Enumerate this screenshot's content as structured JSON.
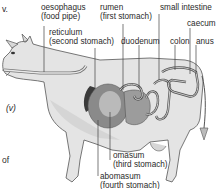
{
  "figure": {
    "labels": {
      "oesophagus": [
        "oesophagus",
        "(food pipe)"
      ],
      "reticulum": [
        "reticulum",
        "(second stomach)"
      ],
      "rumen": [
        "rumen",
        "(first stomach)"
      ],
      "small_intestine": "small intestine",
      "caecum": "caecum",
      "duodenum": "duodenum",
      "colon": "colon",
      "anus": "anus",
      "omasum": [
        "omasum",
        "(third stomach)"
      ],
      "abomasum": [
        "abomasum",
        "(fourth stomach)"
      ]
    },
    "side_text": {
      "top_fragment": "v.",
      "marker": "(v)",
      "bottom_fragment": "of"
    },
    "colors": {
      "body": "#e4e4e4",
      "body_shade": "#c8c8c8",
      "outline": "#555555",
      "rumen": "#8a8a8a",
      "reticulum": "#3a3a3a",
      "intestine": "#bdbdbd",
      "leader_line": "#444444"
    }
  }
}
